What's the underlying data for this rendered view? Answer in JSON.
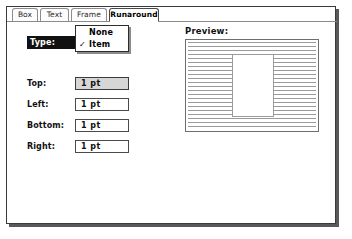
{
  "dialog": {
    "tabs": [
      {
        "label": "Box",
        "active": false
      },
      {
        "label": "Text",
        "active": false
      },
      {
        "label": "Frame",
        "active": false
      },
      {
        "label": "Runaround",
        "active": true
      }
    ],
    "type_row": {
      "label": "Type:",
      "selected_value": "Item"
    },
    "type_menu": {
      "items": [
        {
          "label": "None",
          "checked": false,
          "check_glyph": ""
        },
        {
          "label": "Item",
          "checked": true,
          "check_glyph": "✓"
        }
      ]
    },
    "fields": [
      {
        "label": "Top:",
        "value": "1  pt",
        "shaded": true
      },
      {
        "label": "Left:",
        "value": "1  pt",
        "shaded": false
      },
      {
        "label": "Bottom:",
        "value": "1  pt",
        "shaded": false
      },
      {
        "label": "Right:",
        "value": "1  pt",
        "shaded": false
      }
    ],
    "preview": {
      "title": "Preview:"
    },
    "colors": {
      "border": "#3a3a3a",
      "highlight_bar": "#111111",
      "highlight_text": "#ffffff",
      "field_shaded": "#d6d6d6",
      "texture_line": "#9a9a9a"
    }
  }
}
